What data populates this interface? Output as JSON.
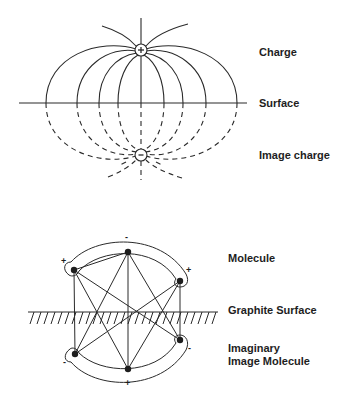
{
  "top_diagram": {
    "labels": {
      "charge": "Charge",
      "surface": "Surface",
      "image_charge": "Image charge"
    },
    "charge_sign": "+",
    "image_charge_sign": "-"
  },
  "bottom_diagram": {
    "labels": {
      "molecule": "Molecule",
      "graphite_surface": "Graphite Surface",
      "imaginary_line1": "Imaginary",
      "imaginary_line2": "Image Molecule"
    },
    "molecule_signs": {
      "top": "-",
      "left": "+",
      "right": "+"
    },
    "image_signs": {
      "bottom": "+",
      "left": "-",
      "right": "-"
    }
  },
  "colors": {
    "line": "#2a2a2a",
    "text": "#1e1e1e",
    "background": "#ffffff"
  }
}
